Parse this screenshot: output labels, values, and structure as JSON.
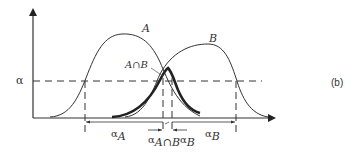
{
  "figure": {
    "panel_label": "(b)",
    "axis_label_y": "α",
    "curves": {
      "a": {
        "label": "A"
      },
      "b": {
        "label": "B"
      },
      "intersection": {
        "label": "A∩B"
      }
    },
    "intervals": {
      "alpha_a": {
        "symbol": "α",
        "subscript": "A"
      },
      "alpha_ab": {
        "symbol": "α",
        "subscript": "A∩B"
      },
      "alpha_b": {
        "symbol": "α",
        "subscript": "B"
      }
    },
    "colors": {
      "stroke": "#333333",
      "thick": "#222222"
    }
  }
}
